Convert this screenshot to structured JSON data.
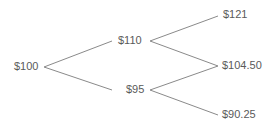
{
  "diagram": {
    "type": "binomial-tree",
    "line_color": "#8a8a8a",
    "text_color": "#5a5a5a",
    "nodes": {
      "root": "$100",
      "up": "$110",
      "down": "$95",
      "up_up": "$121",
      "up_down": "$104.50",
      "down_down": "$90.25"
    }
  }
}
